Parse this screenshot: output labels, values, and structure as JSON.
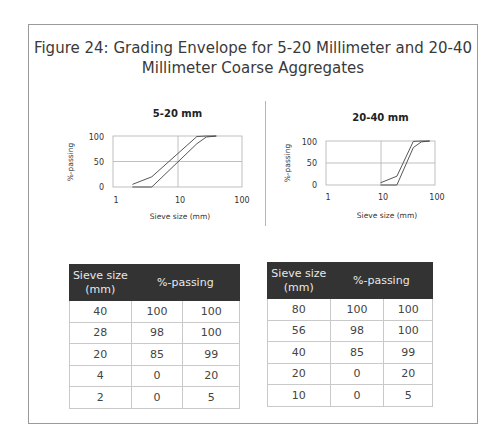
{
  "figure": {
    "title_line1": "Figure 24: Grading Envelope for 5-20 Millimeter and 20-40",
    "title_line2": "Millimeter Coarse Aggregates"
  },
  "charts": [
    {
      "title": "5-20 mm",
      "ylabel": "%-passing",
      "xlabel": "Sieve size (mm)",
      "y_ticks": [
        "100",
        "50",
        "0"
      ],
      "x_ticks": [
        "1",
        "10",
        "100"
      ]
    },
    {
      "title": "20-40 mm",
      "ylabel": "%-passing",
      "xlabel": "Sieve size (mm)",
      "y_ticks": [
        "100",
        "50",
        "0"
      ],
      "x_ticks": [
        "1",
        "10",
        "100"
      ]
    }
  ],
  "tables": [
    {
      "header_sieve_line1": "Sieve size",
      "header_sieve_line2": "(mm)",
      "header_passing": "%-passing",
      "rows": [
        [
          "40",
          "100",
          "100"
        ],
        [
          "28",
          "98",
          "100"
        ],
        [
          "20",
          "85",
          "99"
        ],
        [
          "4",
          "0",
          "20"
        ],
        [
          "2",
          "0",
          "5"
        ]
      ]
    },
    {
      "header_sieve_line1": "Sieve size",
      "header_sieve_line2": "(mm)",
      "header_passing": "%-passing",
      "rows": [
        [
          "80",
          "100",
          "100"
        ],
        [
          "56",
          "98",
          "100"
        ],
        [
          "40",
          "85",
          "99"
        ],
        [
          "20",
          "0",
          "20"
        ],
        [
          "10",
          "0",
          "5"
        ]
      ]
    }
  ],
  "chart_data": [
    {
      "type": "line",
      "title": "5-20 mm",
      "xlabel": "Sieve size (mm)",
      "ylabel": "%-passing",
      "xscale": "log",
      "xlim": [
        1,
        100
      ],
      "ylim": [
        0,
        100
      ],
      "x_ticks": [
        1,
        10,
        100
      ],
      "y_ticks": [
        0,
        50,
        100
      ],
      "grid": true,
      "x": [
        2,
        4,
        20,
        28,
        40
      ],
      "series": [
        {
          "name": "Lower limit",
          "values": [
            0,
            0,
            85,
            98,
            100
          ]
        },
        {
          "name": "Upper limit",
          "values": [
            5,
            20,
            99,
            100,
            100
          ]
        }
      ]
    },
    {
      "type": "line",
      "title": "20-40 mm",
      "xlabel": "Sieve size (mm)",
      "ylabel": "%-passing",
      "xscale": "log",
      "xlim": [
        1,
        100
      ],
      "ylim": [
        0,
        100
      ],
      "x_ticks": [
        1,
        10,
        100
      ],
      "y_ticks": [
        0,
        50,
        100
      ],
      "grid": true,
      "x": [
        10,
        20,
        40,
        56,
        80
      ],
      "series": [
        {
          "name": "Lower limit",
          "values": [
            0,
            0,
            85,
            98,
            100
          ]
        },
        {
          "name": "Upper limit",
          "values": [
            5,
            20,
            99,
            100,
            100
          ]
        }
      ]
    }
  ]
}
